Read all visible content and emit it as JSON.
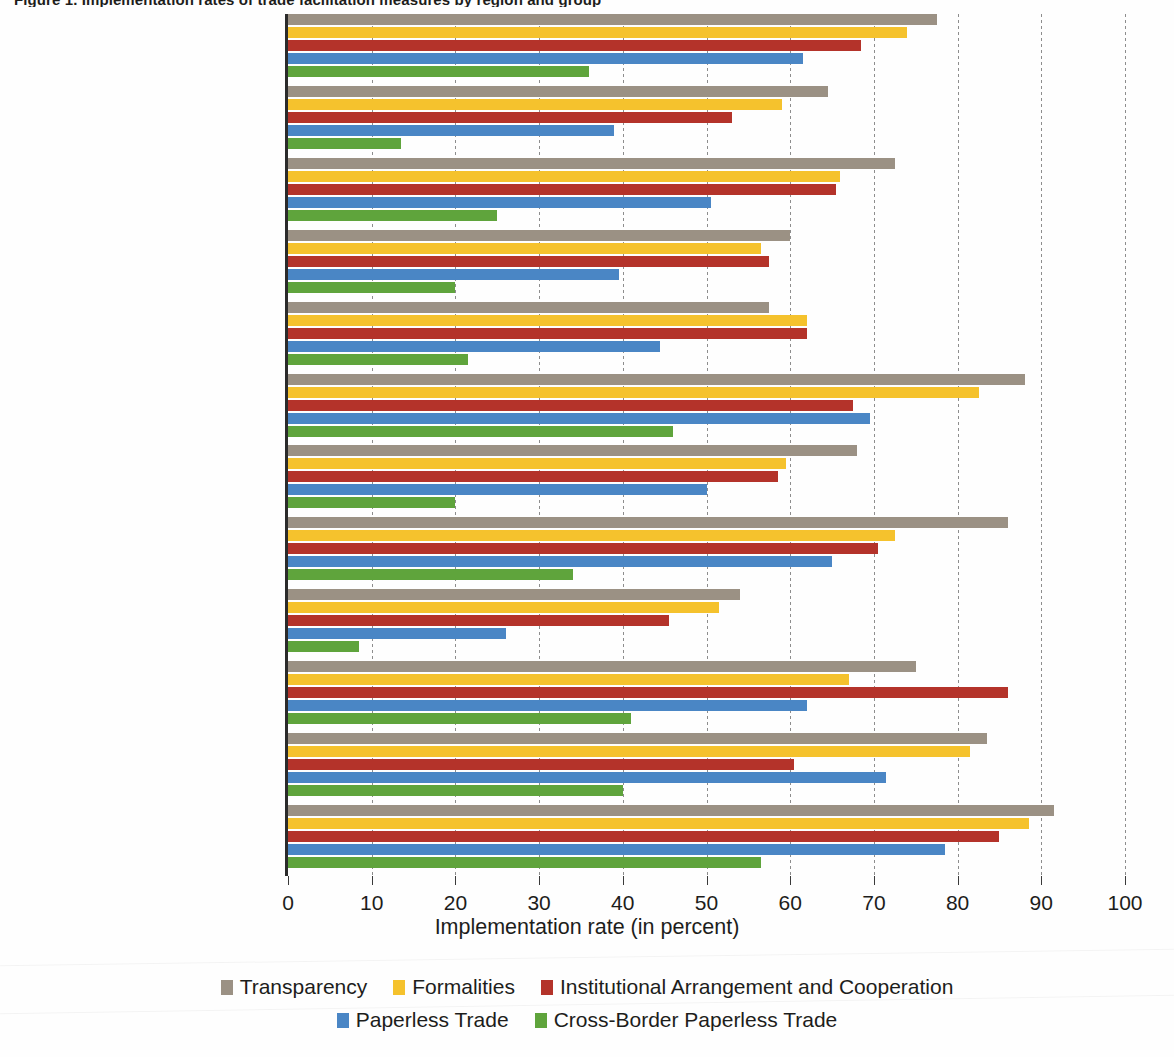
{
  "title": "Figure 1. Implementation rates of trade facilitation measures by region and group",
  "xaxis_title": "Implementation rate (in percent)",
  "colors": {
    "transparency": "#9b9184",
    "formalities": "#f5c22d",
    "institutional": "#b4332a",
    "paperless": "#4a86c5",
    "cross_border": "#5fa43c"
  },
  "legend": {
    "row1": [
      {
        "label": "Transparency",
        "color_key": "transparency"
      },
      {
        "label": "Formalities",
        "color_key": "formalities"
      },
      {
        "label": "Institutional Arrangement and Cooperation",
        "color_key": "institutional"
      }
    ],
    "row2": [
      {
        "label": "Paperless Trade",
        "color_key": "paperless"
      },
      {
        "label": "Cross-Border Paperless Trade",
        "color_key": "cross_border"
      }
    ]
  },
  "chart_data": {
    "type": "bar",
    "orientation": "horizontal",
    "title": "Figure 1. Implementation rates of trade facilitation measures by region and group",
    "xlabel": "Implementation rate (in percent)",
    "ylabel": "",
    "xlim": [
      0,
      100
    ],
    "xticks": [
      0,
      10,
      20,
      30,
      40,
      50,
      60,
      70,
      80,
      90,
      100
    ],
    "grid": true,
    "legend_position": "bottom",
    "categories": [
      "Global Average",
      "SIDS",
      "LLDCs",
      "LDCs",
      "Sub-Saharan Africa",
      "South-East and East Asia",
      "South Asia",
      "South and East Europe,\nCaucasus and Central Asia",
      "Pacific Islands",
      "Middle East and North Africa",
      "Latin America and the Caribbean",
      "Developed Economies"
    ],
    "series": [
      {
        "name": "Transparency",
        "color": "#9b9184",
        "values": [
          77.5,
          64.5,
          72.5,
          60.0,
          57.5,
          88.0,
          68.0,
          86.0,
          54.0,
          75.0,
          83.5,
          91.5
        ]
      },
      {
        "name": "Formalities",
        "color": "#f5c22d",
        "values": [
          74.0,
          59.0,
          66.0,
          56.5,
          62.0,
          82.5,
          59.5,
          72.5,
          51.5,
          67.0,
          81.5,
          88.5
        ]
      },
      {
        "name": "Institutional Arrangement and Cooperation",
        "color": "#b4332a",
        "values": [
          68.5,
          53.0,
          65.5,
          57.5,
          62.0,
          67.5,
          58.5,
          70.5,
          45.5,
          86.0,
          60.5,
          85.0
        ]
      },
      {
        "name": "Paperless Trade",
        "color": "#4a86c5",
        "values": [
          61.5,
          39.0,
          50.5,
          39.5,
          44.5,
          69.5,
          50.0,
          65.0,
          26.0,
          62.0,
          71.5,
          78.5
        ]
      },
      {
        "name": "Cross-Border Paperless Trade",
        "color": "#5fa43c",
        "values": [
          36.0,
          13.5,
          25.0,
          20.0,
          21.5,
          46.0,
          20.0,
          34.0,
          8.5,
          41.0,
          40.0,
          56.5
        ]
      }
    ]
  }
}
